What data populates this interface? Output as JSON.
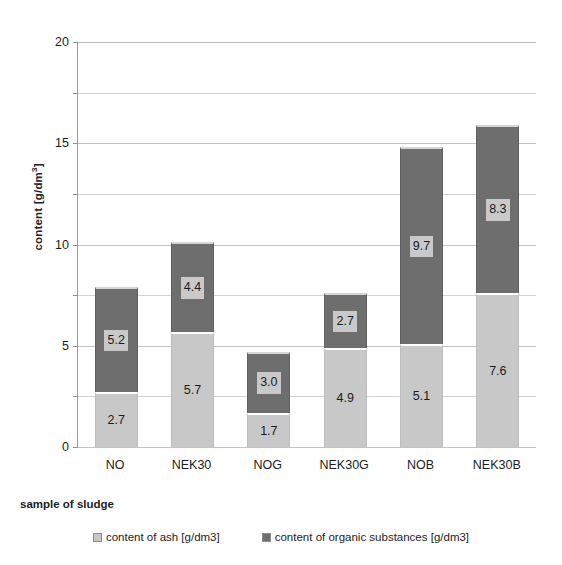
{
  "chart_data": {
    "type": "bar",
    "subtype": "stacked-vertical",
    "title": "",
    "xlabel": "sample of sludge",
    "ylabel": "content [g/dm³]",
    "categories": [
      "NO",
      "NEK30",
      "NOG",
      "NEK30G",
      "NOB",
      "NEK30B"
    ],
    "series": [
      {
        "name": "content of ash [g/dm3]",
        "color": "#c8c8c8",
        "values": [
          2.7,
          5.7,
          1.7,
          4.9,
          5.1,
          7.6
        ],
        "labels": [
          "2.7",
          "5.7",
          "1.7",
          "4.9",
          "5.1",
          "7.6"
        ]
      },
      {
        "name": "content of organic substances [g/dm3]",
        "color": "#6e6e6e",
        "values": [
          5.2,
          4.4,
          3.0,
          2.7,
          9.7,
          8.3
        ],
        "labels": [
          "5.2",
          "4.4",
          "3.0",
          "2.7",
          "9.7",
          "8.3"
        ]
      }
    ],
    "totals": [
      7.9,
      10.1,
      4.7,
      7.6,
      14.8,
      15.9
    ],
    "ylim": [
      0,
      20
    ],
    "y_major_ticks": [
      0,
      5,
      10,
      15,
      20
    ],
    "y_tick_labels": [
      "0",
      "5",
      "10",
      "15",
      "20"
    ],
    "y_minor_ticks": [
      2.5,
      7.5,
      12.5,
      17.5
    ],
    "grid": true,
    "grid_axis": "y",
    "legend_position": "bottom"
  },
  "axis": {
    "y_title": "content [g/dm",
    "y_title_sup": "3",
    "y_title_close": "]",
    "x_title": "sample of sludge"
  },
  "legend": {
    "items": [
      {
        "label": "content of ash [g/dm3]",
        "color": "#c8c8c8"
      },
      {
        "label": "content of organic substances [g/dm3]",
        "color": "#6e6e6e"
      }
    ]
  },
  "colors": {
    "ash": "#c8c8c8",
    "organic": "#6e6e6e",
    "grid": "#d2d2d2",
    "axis": "#9a9a9a",
    "background": "#ffffff",
    "text": "#1d1d1d"
  }
}
